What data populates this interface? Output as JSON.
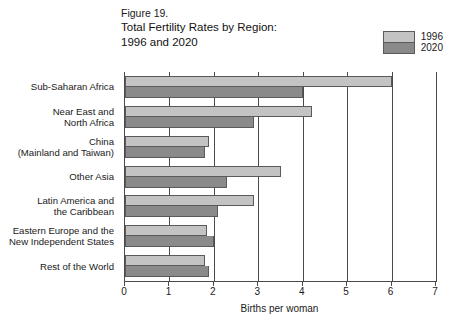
{
  "title": {
    "figure_number": "Figure 19.",
    "line1": "Total Fertility Rates by Region:",
    "line2": "1996 and 2020"
  },
  "legend": {
    "position": "top-right",
    "entries": [
      {
        "label": "1996",
        "color": "#c3c3c3"
      },
      {
        "label": "2020",
        "color": "#8a8a8a"
      }
    ]
  },
  "chart_data": {
    "type": "bar",
    "orientation": "horizontal",
    "title": "Total Fertility Rates by Region: 1996 and 2020",
    "xlabel": "Births per woman",
    "ylabel": "",
    "xlim": [
      0,
      7
    ],
    "xticks": [
      0,
      1,
      2,
      3,
      4,
      5,
      6,
      7
    ],
    "xticklabels": [
      "0",
      "1",
      "2",
      "3",
      "4",
      "5",
      "6",
      "7"
    ],
    "grid": true,
    "legend_position": "top right",
    "categories": [
      "Sub-Saharan Africa",
      "Near East and North Africa",
      "China (Mainland and Taiwan)",
      "Other Asia",
      "Latin America and the Caribbean",
      "Eastern Europe and the New Independent States",
      "Rest of the World"
    ],
    "category_label_lines": [
      [
        "Sub-Saharan Africa"
      ],
      [
        "Near East and",
        "North Africa"
      ],
      [
        "China",
        "(Mainland and Taiwan)"
      ],
      [
        "Other Asia"
      ],
      [
        "Latin America and",
        "the Caribbean"
      ],
      [
        "Eastern Europe and the",
        "New Independent States"
      ],
      [
        "Rest of the World"
      ]
    ],
    "series": [
      {
        "name": "1996",
        "color": "#c3c3c3",
        "values": [
          6.0,
          4.2,
          1.9,
          3.5,
          2.9,
          1.85,
          1.8
        ]
      },
      {
        "name": "2020",
        "color": "#8a8a8a",
        "values": [
          4.0,
          2.9,
          1.8,
          2.3,
          2.1,
          2.0,
          1.9
        ]
      }
    ]
  }
}
